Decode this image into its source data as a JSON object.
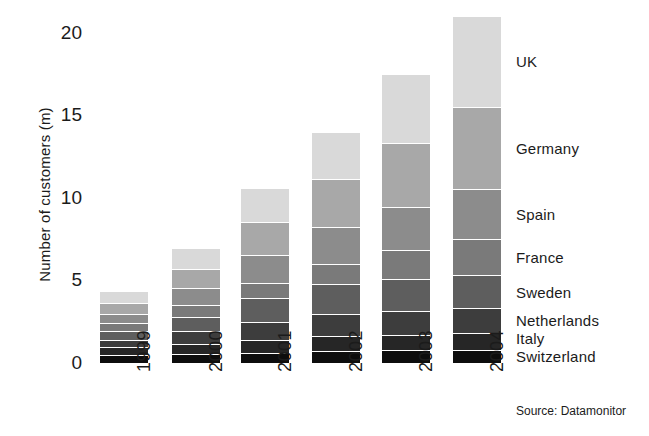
{
  "chart_data": {
    "type": "bar",
    "subtype": "stacked-vertical",
    "title": "",
    "subtitle": "",
    "xlabel": "",
    "ylabel": "Number of customers (m)",
    "categories": [
      "1999",
      "2000",
      "2001",
      "2002",
      "2003",
      "2004"
    ],
    "ylim": [
      0,
      21
    ],
    "yticks": [
      "0",
      "5",
      "10",
      "15",
      "20"
    ],
    "ytick_values": [
      0,
      5,
      10,
      15,
      20
    ],
    "grid": false,
    "legend_position": "right-aligned to stack segments",
    "stack_order_top_to_bottom": [
      "UK",
      "Germany",
      "Spain",
      "France",
      "Sweden",
      "Netherlands",
      "Italy",
      "Switzerland"
    ],
    "series": [
      {
        "name": "UK",
        "color": "#d9d9d9",
        "values": [
          0.75,
          1.3,
          2.1,
          2.9,
          4.2,
          5.5
        ]
      },
      {
        "name": "Germany",
        "color": "#a8a8a8",
        "values": [
          0.65,
          1.15,
          1.95,
          2.85,
          3.85,
          5.0
        ]
      },
      {
        "name": "Spain",
        "color": "#8c8c8c",
        "values": [
          0.55,
          1.0,
          1.7,
          2.25,
          2.6,
          3.0
        ]
      },
      {
        "name": "France",
        "color": "#7a7a7a",
        "values": [
          0.45,
          0.7,
          0.9,
          1.25,
          1.75,
          2.2
        ]
      },
      {
        "name": "Sweden",
        "color": "#5e5e5e",
        "values": [
          0.55,
          0.9,
          1.5,
          1.8,
          1.95,
          2.0
        ]
      },
      {
        "name": "Netherlands",
        "color": "#3d3d3d",
        "values": [
          0.45,
          0.75,
          1.1,
          1.35,
          1.45,
          1.5
        ]
      },
      {
        "name": "Italy",
        "color": "#262626",
        "values": [
          0.45,
          0.6,
          0.75,
          0.9,
          0.95,
          1.0
        ]
      },
      {
        "name": "Switzerland",
        "color": "#0d0d0d",
        "values": [
          0.45,
          0.5,
          0.55,
          0.65,
          0.7,
          0.75
        ]
      }
    ],
    "totals": [
      4.3,
      6.9,
      10.55,
      13.95,
      17.45,
      20.95
    ],
    "annotations": [
      "Source: Datamonitor"
    ]
  },
  "axes": {
    "y_title": "Number of customers (m)",
    "y_ticks": [
      {
        "label": "20",
        "value": 20
      },
      {
        "label": "15",
        "value": 15
      },
      {
        "label": "10",
        "value": 10
      },
      {
        "label": "5",
        "value": 5
      },
      {
        "label": "0",
        "value": 0
      }
    ],
    "x_ticks": [
      {
        "label": "1999"
      },
      {
        "label": "2000"
      },
      {
        "label": "2001"
      },
      {
        "label": "2002"
      },
      {
        "label": "2003"
      },
      {
        "label": "2004"
      }
    ]
  },
  "legend": {
    "entries": [
      {
        "label": "UK",
        "color": "#d9d9d9"
      },
      {
        "label": "Germany",
        "color": "#a8a8a8"
      },
      {
        "label": "Spain",
        "color": "#8c8c8c"
      },
      {
        "label": "France",
        "color": "#7a7a7a"
      },
      {
        "label": "Sweden",
        "color": "#5e5e5e"
      },
      {
        "label": "Netherlands",
        "color": "#3d3d3d"
      },
      {
        "label": "Italy",
        "color": "#262626"
      },
      {
        "label": "Switzerland",
        "color": "#0d0d0d"
      }
    ]
  },
  "source": {
    "text": "Source: Datamonitor"
  }
}
